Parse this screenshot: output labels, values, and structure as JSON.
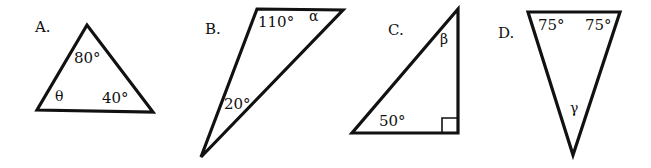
{
  "figure": {
    "stroke_color": "#111111",
    "background": "#ffffff",
    "triangles": [
      {
        "label": "A.",
        "vertices": [
          [
            87,
            25
          ],
          [
            37,
            110
          ],
          [
            153,
            112
          ]
        ],
        "angles": [
          {
            "text": "80°",
            "x": 74,
            "y": 62
          },
          {
            "text": "θ",
            "x": 56,
            "y": 101,
            "unknown": true
          },
          {
            "text": "40°",
            "x": 103,
            "y": 103
          }
        ]
      },
      {
        "label": "B.",
        "vertices": [
          [
            257,
            9
          ],
          [
            343,
            10
          ],
          [
            201,
            157
          ]
        ],
        "angles": [
          {
            "text": "110°",
            "x": 258,
            "y": 26
          },
          {
            "text": "α",
            "x": 309,
            "y": 21,
            "unknown": true
          },
          {
            "text": "20°",
            "x": 224,
            "y": 108
          }
        ]
      },
      {
        "label": "C.",
        "vertices": [
          [
            458,
            9
          ],
          [
            352,
            133
          ],
          [
            458,
            133
          ]
        ],
        "right_angle": true,
        "angles": [
          {
            "text": "β",
            "x": 440,
            "y": 43,
            "unknown": true
          },
          {
            "text": "50°",
            "x": 379,
            "y": 125
          }
        ]
      },
      {
        "label": "D.",
        "vertices": [
          [
            528,
            12
          ],
          [
            620,
            12
          ],
          [
            573,
            155
          ]
        ],
        "angles": [
          {
            "text": "75°",
            "x": 538,
            "y": 29
          },
          {
            "text": "75°",
            "x": 585,
            "y": 29
          },
          {
            "text": "γ",
            "x": 570,
            "y": 112,
            "unknown": true
          }
        ]
      }
    ]
  },
  "labels": {
    "a": "A.",
    "b": "B.",
    "c": "C.",
    "d": "D.",
    "a_top": "80°",
    "a_left": "θ",
    "a_right": "40°",
    "b_top_left": "110°",
    "b_top_right": "α",
    "b_bottom": "20°",
    "c_top": "β",
    "c_bottom_left": "50°",
    "d_top_left": "75°",
    "d_top_right": "75°",
    "d_bottom": "γ"
  }
}
